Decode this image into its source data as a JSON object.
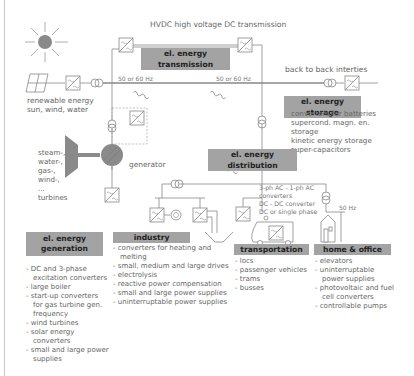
{
  "diagram": {
    "hvdc_label": "HVDC high voltage DC transmission",
    "freq_left": "50 or 60 Hz",
    "freq_right": "50 or 60 Hz",
    "back_to_back": "back to back interties",
    "renewable": [
      "renewable energy",
      "sun, wind, water"
    ],
    "turbines": [
      "steam-,",
      "water-,",
      "gas-,",
      "wind-,",
      "...",
      "turbines"
    ],
    "generator": "generator",
    "converters_note": [
      "3-ph AC - 1-ph AC",
      "converters",
      "DC - DC converter",
      "DC or single phase"
    ],
    "home_freq": "50 Hz",
    "colors": {
      "header_bg": "#a3a3a3",
      "line": "#888888",
      "sun": "#8a8a8a",
      "generator": "#8a8a8a"
    }
  },
  "sections": {
    "transmission": {
      "title": "el. energy transmission"
    },
    "storage": {
      "title": "el. energy storage",
      "items": [
        "converters for batteries",
        "supercond. magn. en.",
        "storage",
        "kinetic energy storage",
        "super-capacitors"
      ]
    },
    "distribution": {
      "title": "el. energy distribution"
    },
    "generation": {
      "title_line1": "el. energy",
      "title_line2": "generation",
      "items": [
        "DC and 3-phase excitation converters",
        "large boiler",
        "start-up converters for gas turbine gen. frequency",
        "wind turbines",
        "solar energy converters",
        "small and large power supplies"
      ]
    },
    "industry": {
      "title": "industry",
      "items": [
        "converters for heating and melting",
        "small, medium and large drives",
        "electrolysis",
        "reactive power compensation",
        "small and large power supplies",
        "uninterruptable power supplies"
      ]
    },
    "transportation": {
      "title": "transportation",
      "items": [
        "locs",
        "passenger vehicles",
        "trams",
        "busses"
      ]
    },
    "home_office": {
      "title": "home & office",
      "items": [
        "elevators",
        "uninterruptable power supplies",
        "photovoltaic and fuel cell converters",
        "controllable pumps"
      ]
    }
  }
}
